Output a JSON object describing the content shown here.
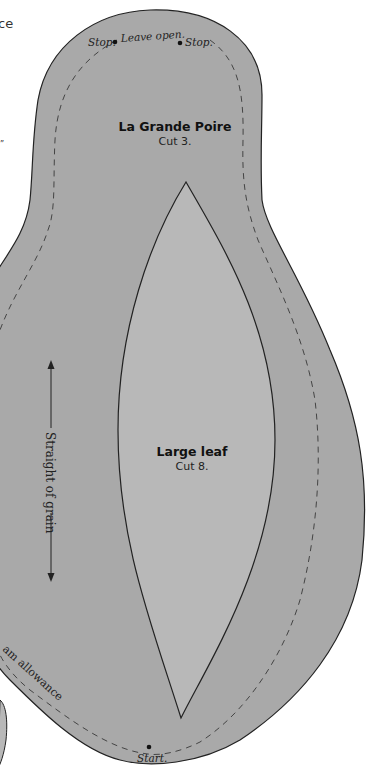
{
  "page": {
    "edge_fragments": [
      "ce",
      "”"
    ]
  },
  "pattern": {
    "title": "La Grande Poire",
    "cut": "Cut 3.",
    "top_labels": {
      "stop_left": "Stop.",
      "leave_open": "Leave open.",
      "stop_right": "Stop."
    },
    "start_label": "Start.",
    "seam_label": "am allowance",
    "colors": {
      "outer_fill": "#a9a9a9",
      "leaf_fill": "#b8b8b8",
      "outline": "#222222",
      "seam_line": "#444444"
    }
  },
  "leaf": {
    "title": "Large leaf",
    "cut": "Cut 8."
  },
  "grain": {
    "label": "Straight of grain"
  }
}
